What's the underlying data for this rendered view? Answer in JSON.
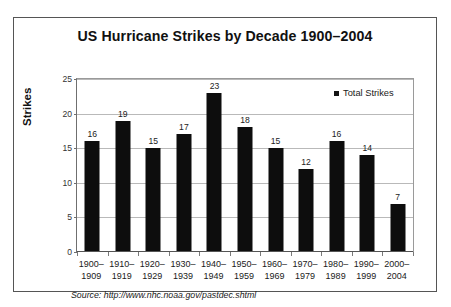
{
  "figure": {
    "title": "US Hurricane Strikes by Decade 1900–2004",
    "y_axis_title": "Strikes",
    "source_note": "Source: http://www.nhc.noaa.gov/pastdec.shtml",
    "legend": {
      "label": "Total Strikes",
      "marker": "square-marker",
      "marker_color": "#141414",
      "position": "top-right-inside"
    },
    "colors": {
      "bar": "#0d0d0d",
      "gridline": "#b9b9b9",
      "axis": "#555555",
      "frame": "#555555",
      "background": "#ffffff",
      "text": "#111111"
    }
  },
  "chart_data": {
    "type": "bar",
    "title": "US Hurricane Strikes by Decade 1900–2004",
    "subtitle": "",
    "xlabel": "",
    "ylabel": "Strikes",
    "ylim": [
      0,
      25
    ],
    "yticks": [
      0,
      5,
      10,
      15,
      20,
      25
    ],
    "ytick_labels": [
      "0",
      "5",
      "10",
      "15",
      "20",
      "25"
    ],
    "grid": true,
    "grid_axis": "y",
    "legend_position": "upper right",
    "categories": [
      "1900–\n1909",
      "1910–\n1919",
      "1920–\n1929",
      "1930–\n1939",
      "1940–\n1949",
      "1950–\n1959",
      "1960–\n1969",
      "1970–\n1979",
      "1980–\n1989",
      "1990–\n1999",
      "2000–\n2004"
    ],
    "category_lines": [
      [
        "1900–",
        "1909"
      ],
      [
        "1910–",
        "1919"
      ],
      [
        "1920–",
        "1929"
      ],
      [
        "1930–",
        "1939"
      ],
      [
        "1940–",
        "1949"
      ],
      [
        "1950–",
        "1959"
      ],
      [
        "1960–",
        "1969"
      ],
      [
        "1970–",
        "1979"
      ],
      [
        "1980–",
        "1989"
      ],
      [
        "1990–",
        "1999"
      ],
      [
        "2000–",
        "2004"
      ]
    ],
    "series": [
      {
        "name": "Total Strikes",
        "color": "#0d0d0d",
        "values": [
          16,
          19,
          15,
          17,
          23,
          18,
          15,
          12,
          16,
          14,
          7
        ],
        "data_labels": [
          "16",
          "19",
          "15",
          "17",
          "23",
          "18",
          "15",
          "12",
          "16",
          "14",
          "7"
        ]
      }
    ],
    "annotations": [
      "Source: http://www.nhc.noaa.gov/pastdec.shtml"
    ]
  }
}
